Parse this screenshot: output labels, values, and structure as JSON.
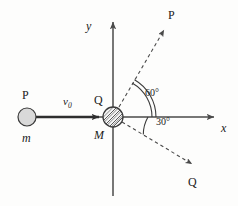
{
  "figure": {
    "type": "physics-collision-diagram"
  },
  "axes": {
    "x_label": "x",
    "y_label": "y",
    "origin": {
      "x": 113,
      "y": 117
    }
  },
  "incoming": {
    "particle_label": "P",
    "mass_label": "m",
    "velocity_label": "v",
    "velocity_subscript": "0",
    "circle": {
      "cx": 27,
      "cy": 117,
      "r": 9,
      "fill": "#d9d9d9",
      "stroke": "#3a3a3a"
    },
    "arrow": {
      "x1": 36,
      "y1": 117,
      "x2": 103,
      "y2": 117
    }
  },
  "target": {
    "top_label": "Q",
    "bottom_label": "M",
    "circle": {
      "cx": 113,
      "cy": 117,
      "r": 10,
      "stroke": "#3a3a3a",
      "hatch": "diagonal"
    }
  },
  "outgoing": [
    {
      "name": "fragment-p",
      "label": "P",
      "angle_deg": 60,
      "direction": "upper-right",
      "ray": {
        "x1": 113,
        "y1": 117,
        "x2": 166,
        "y2": 27
      },
      "label_pos": {
        "x": 169,
        "y": 10
      }
    },
    {
      "name": "fragment-q",
      "label": "Q",
      "angle_deg": -30,
      "direction": "lower-right",
      "ray": {
        "x1": 113,
        "y1": 117,
        "x2": 196,
        "y2": 170
      },
      "label_pos": {
        "x": 190,
        "y": 176
      }
    }
  ],
  "angles": [
    {
      "name": "angle-60",
      "text": "60",
      "unit": "°",
      "arc_style": "double",
      "between": [
        "x-axis",
        "fragment-p-ray"
      ],
      "label_pos": {
        "x": 146,
        "y": 90
      }
    },
    {
      "name": "angle-30",
      "text": "30",
      "unit": "°",
      "arc_style": "single",
      "between": [
        "x-axis",
        "fragment-q-ray"
      ],
      "label_pos": {
        "x": 157,
        "y": 118
      }
    }
  ],
  "colors": {
    "line": "#3a3a3a",
    "dashed": "#4a4a4a",
    "fill_light": "#d9d9d9",
    "background": "#fdfdfc"
  }
}
